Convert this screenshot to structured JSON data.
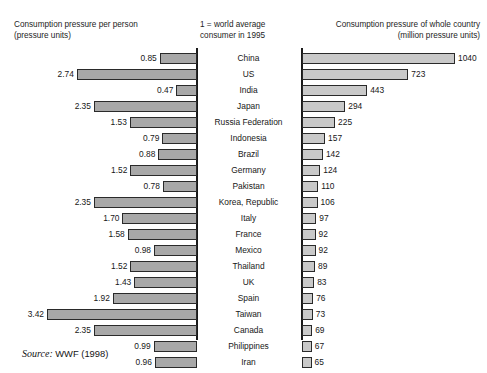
{
  "headers": {
    "left": "Consumption pressure per person\n(pressure units)",
    "middle": "1 = world average\nconsumer in 1995",
    "right": "Consumption pressure of whole country\n(million pressure units)"
  },
  "source": {
    "label": "Source:",
    "text": "WWF (1998)"
  },
  "chart_data": {
    "type": "bar",
    "title": "",
    "orientation": "horizontal",
    "layout": "back-to-back paired bars with central country labels",
    "categories": [
      "China",
      "US",
      "India",
      "Japan",
      "Russia Federation",
      "Indonesia",
      "Brazil",
      "Germany",
      "Pakistan",
      "Korea, Republic",
      "Italy",
      "France",
      "Mexico",
      "Thailand",
      "UK",
      "Spain",
      "Taiwan",
      "Canada",
      "Philippines",
      "Iran"
    ],
    "series": [
      {
        "name": "Consumption pressure per person",
        "unit": "pressure units",
        "side": "left",
        "axis_note": "1 = world average consumer in 1995",
        "values": [
          0.85,
          2.74,
          0.47,
          2.35,
          1.53,
          0.79,
          0.88,
          1.52,
          0.78,
          2.35,
          1.7,
          1.58,
          0.98,
          1.52,
          1.43,
          1.92,
          3.42,
          2.35,
          0.99,
          0.96
        ],
        "max": 3.42
      },
      {
        "name": "Consumption pressure of whole country",
        "unit": "million pressure units",
        "side": "right",
        "values": [
          1040,
          723,
          443,
          294,
          225,
          157,
          142,
          124,
          110,
          106,
          97,
          92,
          92,
          89,
          83,
          76,
          73,
          69,
          67,
          65
        ],
        "max": 1040
      }
    ],
    "grid": false,
    "legend": "none"
  },
  "colors": {
    "left_bar_fill": "#a8a8a8",
    "right_bar_fill": "#c9c9c9",
    "bar_border": "#2a2a2a",
    "axis": "#1a1a1a",
    "text": "#171717",
    "background": "#ffffff"
  }
}
